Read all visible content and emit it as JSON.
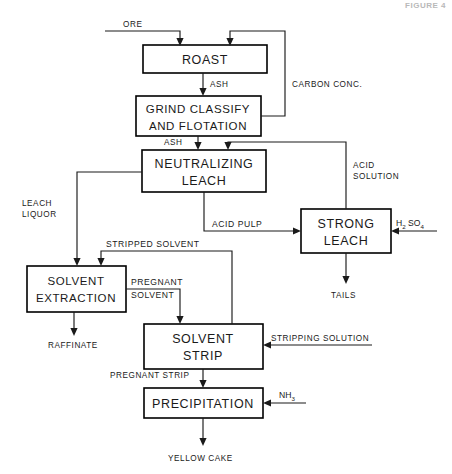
{
  "figure": {
    "caption": "FIGURE 4"
  },
  "diagram": {
    "type": "process-flow-diagram",
    "boxes": [
      {
        "id": "roast",
        "lines": [
          "ROAST"
        ]
      },
      {
        "id": "grind",
        "lines": [
          "GRIND CLASSIFY",
          "AND FLOTATION"
        ]
      },
      {
        "id": "neutralize",
        "lines": [
          "NEUTRALIZING",
          "LEACH"
        ]
      },
      {
        "id": "strong",
        "lines": [
          "STRONG",
          "LEACH"
        ]
      },
      {
        "id": "extraction",
        "lines": [
          "SOLVENT",
          "EXTRACTION"
        ]
      },
      {
        "id": "strip",
        "lines": [
          "SOLVENT",
          "STRIP"
        ]
      },
      {
        "id": "precip",
        "lines": [
          "PRECIPITATION"
        ]
      }
    ],
    "streams": [
      {
        "id": "ore",
        "label": "ORE"
      },
      {
        "id": "ash-1",
        "label": "ASH"
      },
      {
        "id": "carbon-conc",
        "label": "CARBON CONC."
      },
      {
        "id": "ash-2",
        "label": "ASH"
      },
      {
        "id": "acid-solution",
        "label": "ACID SOLUTION"
      },
      {
        "id": "leach-liquor",
        "label": "LEACH LIQUOR"
      },
      {
        "id": "acid-pulp",
        "label": "ACID PULP"
      },
      {
        "id": "sulfuric-acid",
        "label": "H2SO4"
      },
      {
        "id": "tails",
        "label": "TAILS"
      },
      {
        "id": "stripped-solvent",
        "label": "STRIPPED SOLVENT"
      },
      {
        "id": "pregnant-solvent",
        "label": "PREGNANT SOLVENT"
      },
      {
        "id": "raffinate",
        "label": "RAFFINATE"
      },
      {
        "id": "stripping-solution",
        "label": "STRIPPING SOLUTION"
      },
      {
        "id": "pregnant-strip",
        "label": "PREGNANT STRIP"
      },
      {
        "id": "ammonia",
        "label": "NH3"
      },
      {
        "id": "yellow-cake",
        "label": "YELLOW CAKE"
      }
    ],
    "labels": {
      "ore": "ORE",
      "ash_1": "ASH",
      "carbon_conc": "CARBON CONC.",
      "ash_2": "ASH",
      "acid_solution_1": "ACID",
      "acid_solution_2": "SOLUTION",
      "leach_liquor_1": "LEACH",
      "leach_liquor_2": "LIQUOR",
      "acid_pulp": "ACID PULP",
      "h2so4_h": "H",
      "h2so4_2": "2",
      "h2so4_so": "SO",
      "h2so4_4": "4",
      "tails": "TAILS",
      "stripped_solvent": "STRIPPED SOLVENT",
      "pregnant": "PREGNANT",
      "solvent": "SOLVENT",
      "raffinate": "RAFFINATE",
      "stripping_solution": "STRIPPING SOLUTION",
      "pregnant_strip": "PREGNANT STRIP",
      "nh3_n": "NH",
      "nh3_3": "3",
      "yellow_cake": "YELLOW CAKE",
      "box_roast": "ROAST",
      "box_grind_1": "GRIND CLASSIFY",
      "box_grind_2": "AND FLOTATION",
      "box_neutral_1": "NEUTRALIZING",
      "box_neutral_2": "LEACH",
      "box_strong_1": "STRONG",
      "box_strong_2": "LEACH",
      "box_extract_1": "SOLVENT",
      "box_extract_2": "EXTRACTION",
      "box_strip_1": "SOLVENT",
      "box_strip_2": "STRIP",
      "box_precip": "PRECIPITATION"
    },
    "colors": {
      "line": "#1a1a1a",
      "box_stroke": "#000000",
      "background": "#ffffff",
      "figure_caption": "#b9b9b9"
    }
  }
}
